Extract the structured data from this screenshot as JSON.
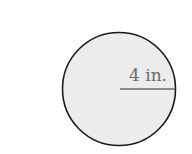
{
  "figure": {
    "shape": "circle",
    "radius_label": "4 in.",
    "colors": {
      "fill": "#ececec",
      "outline": "#1a1a1a",
      "radius_line": "#6b6b6b",
      "label": "#6b6b6b"
    }
  }
}
